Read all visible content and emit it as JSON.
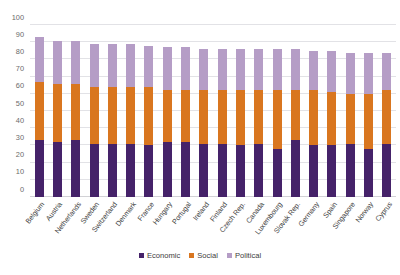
{
  "chart_data": {
    "type": "bar",
    "subtype": "stacked-vertical",
    "title": "",
    "subtitle": "",
    "xlabel": "",
    "ylabel": "",
    "ylim": [
      0,
      100
    ],
    "ytick_step": 10,
    "yticks": [
      0,
      10,
      20,
      30,
      40,
      50,
      60,
      70,
      80,
      90,
      100
    ],
    "ytick_labels": [
      "0",
      "10",
      "20",
      "30",
      "40",
      "50",
      "60",
      "70",
      "80",
      "90",
      "100"
    ],
    "grid": true,
    "grid_axis": "y",
    "legend_position": "bottom-center",
    "legend": [
      "Economic",
      "Social",
      "Political"
    ],
    "xtick_rotation": -52,
    "categories": [
      "Belgium",
      "Austria",
      "Netherlands",
      "Sweden",
      "Switzerland",
      "Denmark",
      "France",
      "Hungary",
      "Portugal",
      "Ireland",
      "Finland",
      "Czech Rep.",
      "Canada",
      "Luxembourg",
      "Slovak Rep.",
      "Germany",
      "Spain",
      "Singapore",
      "Norway",
      "Cyprus"
    ],
    "series": [
      {
        "name": "Economic",
        "color": "#452269",
        "values": [
          33,
          32,
          33,
          31,
          31,
          31,
          30,
          32,
          32,
          31,
          31,
          30,
          31,
          28,
          33,
          30,
          30,
          31,
          28,
          31
        ]
      },
      {
        "name": "Social",
        "color": "#d9761f",
        "values": [
          34,
          34,
          33,
          33,
          33,
          33,
          34,
          30,
          30,
          31,
          31,
          32,
          31,
          34,
          29,
          32,
          31,
          29,
          32,
          31
        ]
      },
      {
        "name": "Political",
        "color": "#b59dc6",
        "values": [
          26,
          25,
          25,
          25,
          25,
          25,
          24,
          25,
          25,
          24,
          24,
          24,
          24,
          24,
          24,
          23,
          24,
          24,
          24,
          22
        ]
      }
    ],
    "totals": [
      93,
      91,
      91,
      89,
      89,
      89,
      88,
      87,
      87,
      86,
      86,
      86,
      86,
      86,
      86,
      85,
      85,
      84,
      84,
      84
    ]
  },
  "colors": {
    "economic": "#452269",
    "social": "#d9761f",
    "political": "#b59dc6",
    "gridline": "#e2e2e6",
    "axis_text": "#6b6b6b",
    "label_text": "#3d3d3d",
    "background": "#ffffff"
  }
}
